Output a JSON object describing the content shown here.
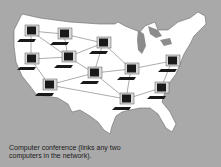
{
  "caption": {
    "line1": "Computer conference (links any two",
    "line2": "computers in the network)."
  },
  "colors": {
    "background": "#a9a9a9",
    "land": "#ffffff",
    "water": "#8c8c8c",
    "screen": "#1a1a1a",
    "monitor": "#d8d8d8",
    "link": "#888888"
  },
  "computers": [
    {
      "id": "c1",
      "x": 25,
      "y": 25
    },
    {
      "id": "c2",
      "x": 58,
      "y": 28
    },
    {
      "id": "c3",
      "x": 97,
      "y": 37
    },
    {
      "id": "c4",
      "x": 25,
      "y": 53
    },
    {
      "id": "c5",
      "x": 62,
      "y": 51
    },
    {
      "id": "c6",
      "x": 88,
      "y": 67
    },
    {
      "id": "c7",
      "x": 43,
      "y": 79
    },
    {
      "id": "c8",
      "x": 125,
      "y": 63
    },
    {
      "id": "c9",
      "x": 166,
      "y": 55
    },
    {
      "id": "c10",
      "x": 155,
      "y": 82
    },
    {
      "id": "c11",
      "x": 120,
      "y": 93
    }
  ],
  "links": [
    [
      "c1",
      "c2"
    ],
    [
      "c1",
      "c4"
    ],
    [
      "c1",
      "c5"
    ],
    [
      "c2",
      "c3"
    ],
    [
      "c2",
      "c5"
    ],
    [
      "c4",
      "c5"
    ],
    [
      "c4",
      "c7"
    ],
    [
      "c5",
      "c3"
    ],
    [
      "c3",
      "c6"
    ],
    [
      "c3",
      "c8"
    ],
    [
      "c5",
      "c6"
    ],
    [
      "c6",
      "c7"
    ],
    [
      "c6",
      "c8"
    ],
    [
      "c7",
      "c11"
    ],
    [
      "c6",
      "c11"
    ],
    [
      "c8",
      "c9"
    ],
    [
      "c8",
      "c11"
    ],
    [
      "c9",
      "c10"
    ],
    [
      "c10",
      "c11"
    ]
  ]
}
